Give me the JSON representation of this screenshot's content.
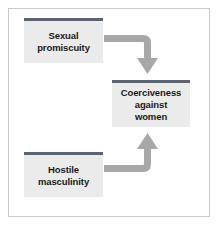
{
  "figure": {
    "type": "flow-diagram",
    "frame": {
      "border_color": "#c9c9c9",
      "background": "#ffffff"
    },
    "style": {
      "node_fill": "#ebebeb",
      "node_top_bar": "#5b6470",
      "arrow_color": "#a8a8a8",
      "text_color": "#1a1a1a"
    },
    "nodes": [
      {
        "id": "sexual-promiscuity",
        "label": "Sexual\npromiscuity",
        "position": "top-left"
      },
      {
        "id": "hostile-masculinity",
        "label": "Hostile\nmasculinity",
        "position": "bottom-left"
      },
      {
        "id": "coerciveness",
        "label": "Coerciveness\nagainst\nwomen",
        "position": "middle-right"
      }
    ],
    "arrows": [
      {
        "id": "arrow-promiscuity-to-coerciveness",
        "from": "sexual-promiscuity",
        "to": "coerciveness",
        "shape": "elbow-right-then-down",
        "head": "down"
      },
      {
        "id": "arrow-masculinity-to-coerciveness",
        "from": "hostile-masculinity",
        "to": "coerciveness",
        "shape": "elbow-right-then-up",
        "head": "up"
      }
    ]
  }
}
